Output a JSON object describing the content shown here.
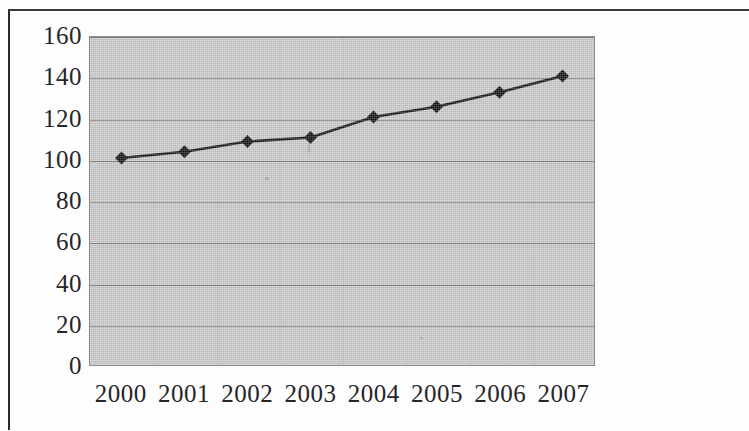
{
  "document": {
    "kind": "scanned-figure",
    "border_color": "#2b2b2b",
    "page_background": "#fdfdfd"
  },
  "chart_data": {
    "type": "line",
    "title": "",
    "subtitle": "",
    "xlabel": "",
    "ylabel": "",
    "categories": [
      "2000",
      "2001",
      "2002",
      "2003",
      "2004",
      "2005",
      "2006",
      "2007"
    ],
    "values": [
      101,
      104,
      109,
      111,
      121,
      126,
      133,
      141
    ],
    "series": [
      {
        "name": "",
        "values": [
          101,
          104,
          109,
          111,
          121,
          126,
          133,
          141
        ],
        "line_color": "#111111",
        "marker": "diamond",
        "marker_color": "#0d0d0d"
      }
    ],
    "ylim": [
      0,
      160
    ],
    "yticks": [
      0,
      20,
      40,
      60,
      80,
      100,
      120,
      140,
      160
    ],
    "ytick_labels": [
      "0",
      "20",
      "40",
      "60",
      "80",
      "100",
      "120",
      "140",
      "160"
    ],
    "xtick_labels": [
      "2000",
      "2001",
      "2002",
      "2003",
      "2004",
      "2005",
      "2006",
      "2007"
    ],
    "grid": true,
    "grid_axis": "y",
    "grid_color": "#6f6f6f",
    "legend": false,
    "legend_position": "none",
    "plot_background": "#c9c9c9",
    "plot_border_color": "#8d8d8d"
  }
}
